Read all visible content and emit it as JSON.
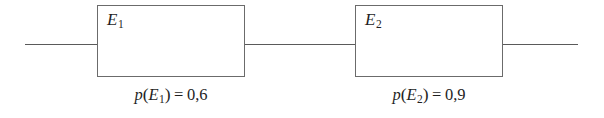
{
  "diagram": {
    "type": "reliability-block-diagram",
    "line_color": "#5a5a5a",
    "border_color": "#6b6b6b",
    "background_color": "#ffffff",
    "text_color": "#1f1f1f",
    "blocks": [
      {
        "id": "E1",
        "label_base": "E",
        "label_sub": "1",
        "probability_function": "p",
        "probability_operator": "=",
        "probability_value": "0,6",
        "probability_text": "p(E1) = 0,6"
      },
      {
        "id": "E2",
        "label_base": "E",
        "label_sub": "2",
        "probability_function": "p",
        "probability_operator": "=",
        "probability_value": "0,9",
        "probability_text": "p(E2) = 0,9"
      }
    ],
    "wires": [
      {
        "name": "left-lead"
      },
      {
        "name": "middle-link"
      },
      {
        "name": "right-lead"
      }
    ]
  }
}
